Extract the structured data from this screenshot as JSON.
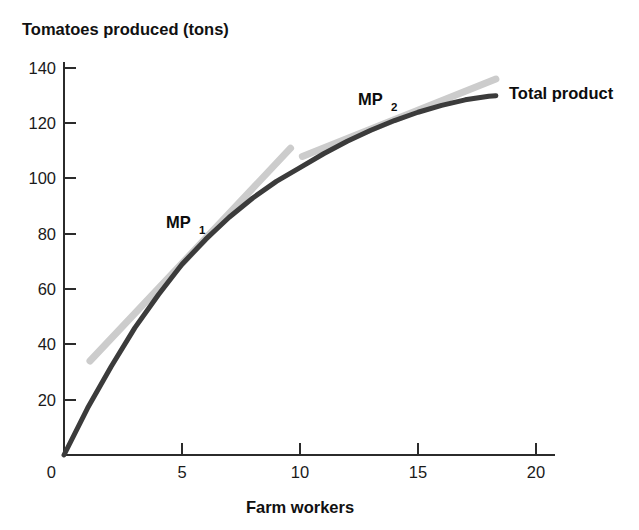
{
  "chart_data": {
    "type": "line",
    "title": "",
    "ylabel": "Tomatoes produced (tons)",
    "xlabel": "Farm workers",
    "xlim": [
      0,
      21
    ],
    "ylim": [
      0,
      145
    ],
    "xticks": [
      "0",
      "5",
      "10",
      "15",
      "20"
    ],
    "xtick_values": [
      0,
      5,
      10,
      15,
      20
    ],
    "yticks": [
      "0",
      "20",
      "40",
      "60",
      "80",
      "100",
      "120",
      "140"
    ],
    "ytick_values": [
      0,
      20,
      40,
      60,
      80,
      100,
      120,
      140
    ],
    "grid": false,
    "legend_position": "inline-right",
    "series": [
      {
        "name": "Total product",
        "color": "#3b3b3b",
        "x": [
          0,
          1,
          2,
          3,
          4,
          5,
          6,
          7,
          8,
          9,
          10,
          11,
          12,
          13,
          14,
          15,
          16,
          17,
          18,
          18.3
        ],
        "values": [
          0,
          17,
          32,
          46,
          58,
          69,
          78,
          86,
          93,
          99,
          104,
          109,
          113.5,
          117.5,
          121,
          124,
          126.5,
          128.5,
          129.8,
          130
        ]
      },
      {
        "name": "MP1 tangent",
        "color": "#cccccc",
        "x": [
          1.1,
          9.6
        ],
        "values": [
          34,
          111
        ]
      },
      {
        "name": "MP2 tangent",
        "color": "#cccccc",
        "x": [
          10.1,
          18.3
        ],
        "values": [
          108,
          136
        ]
      }
    ],
    "annotations": [
      {
        "id": "mp1",
        "text": "MP",
        "sub": "1",
        "x": 4.6,
        "y": 88
      },
      {
        "id": "mp2",
        "text": "MP",
        "sub": "2",
        "x": 12.5,
        "y": 131
      }
    ],
    "series_label": "Total product"
  },
  "colors": {
    "curve": "#3b3b3b",
    "tangent": "#cccccc",
    "axis": "#2b2b2b",
    "text": "#111111",
    "background": "#ffffff"
  }
}
